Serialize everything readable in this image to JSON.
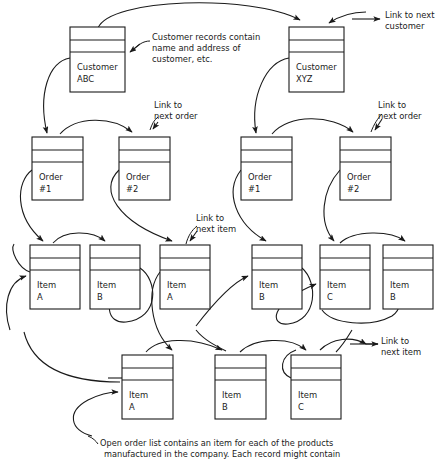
{
  "diagram": {
    "stroke_color": "#1a1a1a",
    "background_color": "#ffffff",
    "records": [
      {
        "id": "customer-abc",
        "line1": "Customer",
        "line2": "ABC",
        "x": 70,
        "y": 27,
        "w": 55,
        "h": 65
      },
      {
        "id": "customer-xyz",
        "line1": "Customer",
        "line2": "XYZ",
        "x": 289,
        "y": 27,
        "w": 55,
        "h": 65
      },
      {
        "id": "order-1-left",
        "line1": "Order",
        "line2": "#1",
        "x": 32,
        "y": 137,
        "w": 51,
        "h": 63
      },
      {
        "id": "order-2-left",
        "line1": "Order",
        "line2": "#2",
        "x": 119,
        "y": 137,
        "w": 51,
        "h": 63
      },
      {
        "id": "order-1-right",
        "line1": "Order",
        "line2": "#1",
        "x": 241,
        "y": 137,
        "w": 51,
        "h": 63
      },
      {
        "id": "order-2-right",
        "line1": "Order",
        "line2": "#2",
        "x": 340,
        "y": 137,
        "w": 51,
        "h": 63
      },
      {
        "id": "item-a-1",
        "line1": "Item",
        "line2": "A",
        "x": 30,
        "y": 245,
        "w": 50,
        "h": 64
      },
      {
        "id": "item-b-1",
        "line1": "Item",
        "line2": "B",
        "x": 90,
        "y": 245,
        "w": 50,
        "h": 64
      },
      {
        "id": "item-a-2",
        "line1": "Item",
        "line2": "A",
        "x": 160,
        "y": 245,
        "w": 50,
        "h": 64
      },
      {
        "id": "item-b-2",
        "line1": "Item",
        "line2": "B",
        "x": 252,
        "y": 245,
        "w": 50,
        "h": 64
      },
      {
        "id": "item-c-1",
        "line1": "Item",
        "line2": "C",
        "x": 320,
        "y": 245,
        "w": 50,
        "h": 64
      },
      {
        "id": "item-b-3",
        "line1": "Item",
        "line2": "B",
        "x": 383,
        "y": 245,
        "w": 50,
        "h": 64
      },
      {
        "id": "item-a-3",
        "line1": "Item",
        "line2": "A",
        "x": 122,
        "y": 355,
        "w": 51,
        "h": 64
      },
      {
        "id": "item-b-4",
        "line1": "Item",
        "line2": "B",
        "x": 215,
        "y": 355,
        "w": 51,
        "h": 64
      },
      {
        "id": "item-c-2",
        "line1": "Item",
        "line2": "C",
        "x": 291,
        "y": 355,
        "w": 50,
        "h": 64
      }
    ],
    "annotations": [
      {
        "id": "customer-records-note",
        "lines": [
          "Customer records contain",
          "name and address of",
          "customer, etc."
        ],
        "x": 152,
        "y": 40
      },
      {
        "id": "link-to-next-customer",
        "lines": [
          "Link to next",
          "customer"
        ],
        "x": 385,
        "y": 18
      },
      {
        "id": "link-to-next-order-left",
        "lines": [
          "Link to",
          "next order"
        ],
        "x": 154,
        "y": 108
      },
      {
        "id": "link-to-next-order-right",
        "lines": [
          "Link to",
          "next order"
        ],
        "x": 378,
        "y": 108
      },
      {
        "id": "link-to-next-item-middle",
        "lines": [
          "Link to",
          "next item"
        ],
        "x": 196,
        "y": 221
      },
      {
        "id": "link-to-next-item-right",
        "lines": [
          "Link to",
          "next item"
        ],
        "x": 381,
        "y": 344
      }
    ],
    "caption": {
      "id": "open-order-list-caption",
      "lines": [
        "Open order list contains an item for each of the products",
        "manufactured in the company. Each record might contain"
      ],
      "x": 100,
      "y": 446
    }
  }
}
